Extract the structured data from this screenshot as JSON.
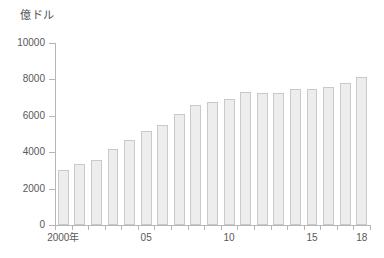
{
  "chart_data": {
    "type": "bar",
    "title": "",
    "unit_label": "億ドル",
    "xlabel": "",
    "ylabel": "",
    "ylim": [
      0,
      10000
    ],
    "grid": false,
    "legend": "none",
    "y_ticks": [
      {
        "value": 10000,
        "label": "10000"
      },
      {
        "value": 8000,
        "label": "8000"
      },
      {
        "value": 6000,
        "label": "6000"
      },
      {
        "value": 4000,
        "label": "4000"
      },
      {
        "value": 2000,
        "label": "2000"
      },
      {
        "value": 0,
        "label": "0"
      }
    ],
    "x_ticks": [
      {
        "index": 0,
        "label": "2000年"
      },
      {
        "index": 5,
        "label": "05"
      },
      {
        "index": 10,
        "label": "10"
      },
      {
        "index": 15,
        "label": "15"
      },
      {
        "index": 18,
        "label": "18"
      }
    ],
    "categories": [
      "2000",
      "2001",
      "2002",
      "2003",
      "2004",
      "2005",
      "2006",
      "2007",
      "2008",
      "2009",
      "2010",
      "2011",
      "2012",
      "2013",
      "2014",
      "2015",
      "2016",
      "2017",
      "2018"
    ],
    "values": [
      3050,
      3350,
      3550,
      4150,
      4650,
      5150,
      5500,
      6100,
      6600,
      6750,
      6950,
      7300,
      7250,
      7250,
      7450,
      7500,
      7600,
      7800,
      8150
    ],
    "bar_color": "#ededee",
    "bar_border_color": "#c9c9cb",
    "axis_color": "#b6b6b8",
    "text_color": "#58585a"
  }
}
